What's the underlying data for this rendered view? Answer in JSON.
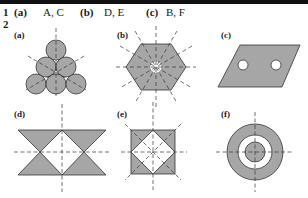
{
  "header_bar": {
    "color": "#111111"
  },
  "question1": {
    "number": "1",
    "parts": [
      {
        "label": "(a)",
        "answer": "A, C"
      },
      {
        "label": "(b)",
        "answer": "D, E"
      },
      {
        "label": "(c)",
        "answer": "B, F"
      }
    ]
  },
  "question2": {
    "number": "2",
    "figures": [
      {
        "label": "(a)",
        "description": "five circles arranged in triangle with three lines of symmetry"
      },
      {
        "label": "(b)",
        "description": "hexagon with star-shaped hole and six lines of symmetry"
      },
      {
        "label": "(c)",
        "description": "parallelogram with two circular holes, no lines of symmetry"
      },
      {
        "label": "(d)",
        "description": "bowtie triangles shape with two lines of symmetry"
      },
      {
        "label": "(e)",
        "description": "square with inscribed diamond hole and four lines of symmetry"
      },
      {
        "label": "(f)",
        "description": "concentric rings with two lines of symmetry"
      }
    ]
  },
  "colors": {
    "fill": "#a6a6a6",
    "stroke": "#333333",
    "dash": "#333333"
  }
}
